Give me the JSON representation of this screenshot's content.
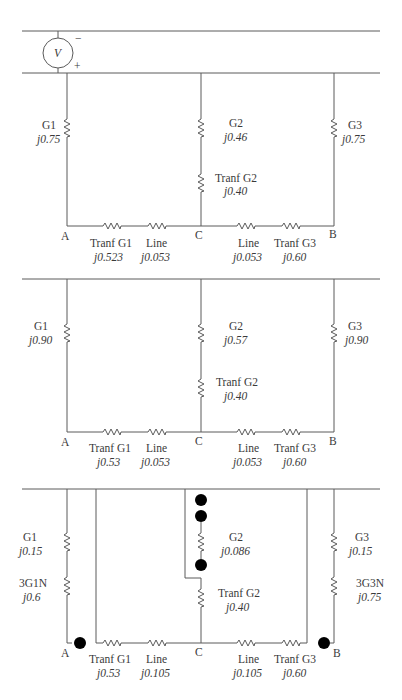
{
  "diagram": {
    "type": "power-system sequence networks",
    "panels": [
      {
        "name": "positive-sequence",
        "source": {
          "symbol": "V",
          "minus": "−",
          "plus": "+"
        },
        "branches": {
          "g1": {
            "name": "G1",
            "value": "j0.75"
          },
          "g2": {
            "name": "G2",
            "value": "j0.46"
          },
          "tg2": {
            "name": "Tranf G2",
            "value": "j0.40"
          },
          "g3": {
            "name": "G3",
            "value": "j0.75"
          }
        },
        "series": [
          {
            "name": "Tranf G1",
            "value": "j0.523"
          },
          {
            "name": "Line",
            "value": "j0.053"
          },
          {
            "name": "Line",
            "value": "j0.053"
          },
          {
            "name": "Tranf G3",
            "value": "j0.60"
          }
        ],
        "nodes": {
          "a": "A",
          "c": "C",
          "b": "B"
        }
      },
      {
        "name": "negative-sequence",
        "branches": {
          "g1": {
            "name": "G1",
            "value": "j0.90"
          },
          "g2": {
            "name": "G2",
            "value": "j0.57"
          },
          "tg2": {
            "name": "Tranf G2",
            "value": "j0.40"
          },
          "g3": {
            "name": "G3",
            "value": "j0.90"
          }
        },
        "series": [
          {
            "name": "Tranf G1",
            "value": "j0.53"
          },
          {
            "name": "Line",
            "value": "j0.053"
          },
          {
            "name": "Line",
            "value": "j0.053"
          },
          {
            "name": "Tranf G3",
            "value": "j0.60"
          }
        ],
        "nodes": {
          "a": "A",
          "c": "C",
          "b": "B"
        }
      },
      {
        "name": "zero-sequence",
        "branches": {
          "g1": {
            "name": "G1",
            "value": "j0.15"
          },
          "g1n": {
            "name": "3G1N",
            "value": "j0.6"
          },
          "g2": {
            "name": "G2",
            "value": "j0.086"
          },
          "tg2": {
            "name": "Tranf G2",
            "value": "j0.40"
          },
          "g3": {
            "name": "G3",
            "value": "j0.15"
          },
          "g3n": {
            "name": "3G3N",
            "value": "j0.75"
          }
        },
        "series": [
          {
            "name": "Tranf G1",
            "value": "j0.53"
          },
          {
            "name": "Line",
            "value": "j0.105"
          },
          {
            "name": "Line",
            "value": "j0.105"
          },
          {
            "name": "Tranf G3",
            "value": "j0.60"
          }
        ],
        "nodes": {
          "a": "A",
          "c": "C",
          "b": "B"
        }
      }
    ]
  }
}
